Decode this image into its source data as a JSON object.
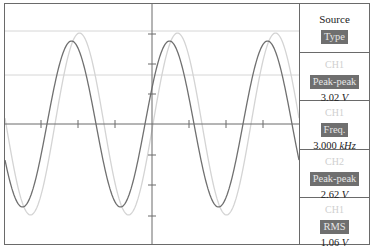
{
  "scope": {
    "colors": {
      "frame": "#6a6a6a",
      "axis": "#6a6a6a",
      "cursor_lines": "#d6d6d6",
      "ch1_trace": "#707070",
      "ch2_trace": "#d4d4d4"
    },
    "graticule": {
      "center_x": 147,
      "center_y": 120,
      "x_ticks": [
        36,
        73,
        110,
        184,
        221,
        258
      ],
      "y_ticks": [
        30,
        60,
        90,
        151,
        181,
        212
      ]
    },
    "cursors": {
      "y_positions": [
        27,
        71
      ]
    },
    "traces": [
      {
        "name": "CH1",
        "amplitude_px": 83,
        "period_px": 98,
        "phase_px": 42,
        "color_key": "ch1_trace"
      },
      {
        "name": "CH2",
        "amplitude_px": 91,
        "period_px": 98,
        "phase_px": 50,
        "color_key": "ch2_trace"
      }
    ]
  },
  "measure_menu": {
    "items": [
      {
        "source_label": "Source",
        "type_label": "Type"
      },
      {
        "channel": "CH1",
        "measurement": "Peak-peak",
        "value": "3.02",
        "unit": "V"
      },
      {
        "channel": "CH1",
        "measurement": "Freq.",
        "value": "3.000",
        "unit": "kHz"
      },
      {
        "channel": "CH2",
        "measurement": "Peak-peak",
        "value": "2.62",
        "unit": "V"
      },
      {
        "channel": "CH1",
        "measurement": "RMS",
        "value": "1.06",
        "unit": "V"
      }
    ]
  }
}
